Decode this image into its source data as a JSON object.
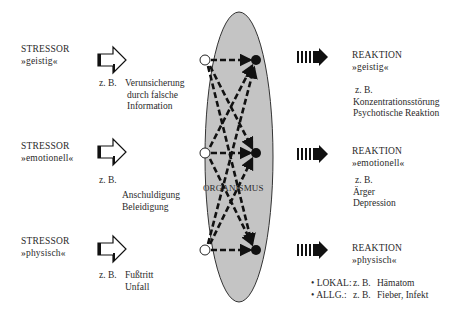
{
  "stressors": [
    {
      "title": "STRESSOR",
      "type": "»geistig«",
      "zb": "z. B.",
      "examples": [
        "Verunsicherung",
        "durch falsche",
        "Information"
      ]
    },
    {
      "title": "STRESSOR",
      "type": "»emotionell«",
      "zb": "z. B.",
      "examples": [
        "Anschuldigung",
        "Beleidigung"
      ]
    },
    {
      "title": "STRESSOR",
      "type": "»physisch«",
      "zb": "z. B.",
      "examples": [
        "Fußtritt",
        "Unfall"
      ]
    }
  ],
  "organism": {
    "label": "ORGANISMUS",
    "fill": "#c4c4c4"
  },
  "reactions": [
    {
      "title": "REAKTION",
      "type": "»geistig«",
      "zb": "z. B.",
      "examples": [
        "Konzentrationsstörung",
        "Psychotische Reaktion"
      ]
    },
    {
      "title": "REAKTION",
      "type": "»emotionell«",
      "zb": "z. B.",
      "examples": [
        "Ärger",
        "Depression"
      ]
    },
    {
      "title": "REAKTION",
      "type": "»physisch«",
      "bullets": [
        {
          "key": "• LOKAL:",
          "zb": "z. B.",
          "value": "Hämatom"
        },
        {
          "key": "• ALLG.:",
          "zb": "z. B.",
          "value": "Fieber, Infekt"
        }
      ]
    }
  ]
}
